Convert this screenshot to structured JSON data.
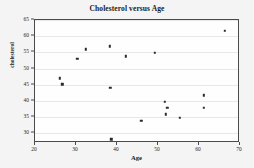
{
  "chart_data": {
    "type": "scatter",
    "title": "Cholesterol versus Age",
    "xlabel": "Age",
    "ylabel": "cholesterol",
    "xlim": [
      20,
      70
    ],
    "ylim": [
      27,
      65
    ],
    "xticks": [
      20,
      30,
      40,
      50,
      60,
      70
    ],
    "yticks": [
      30,
      35,
      40,
      45,
      50,
      55,
      60,
      65
    ],
    "grid": "horizontal",
    "legend": "none",
    "marker": "filled-square",
    "marker_color": "#2a2a2a",
    "points": [
      {
        "x": 26.0,
        "y": 47.0
      },
      {
        "x": 26.7,
        "y": 45.1
      },
      {
        "x": 30.3,
        "y": 53.0
      },
      {
        "x": 32.4,
        "y": 56.0
      },
      {
        "x": 38.2,
        "y": 56.9
      },
      {
        "x": 38.4,
        "y": 44.1
      },
      {
        "x": 38.6,
        "y": 28.1
      },
      {
        "x": 42.2,
        "y": 53.8
      },
      {
        "x": 45.9,
        "y": 33.9
      },
      {
        "x": 49.2,
        "y": 54.9
      },
      {
        "x": 51.6,
        "y": 39.8
      },
      {
        "x": 51.9,
        "y": 35.9
      },
      {
        "x": 52.3,
        "y": 37.8
      },
      {
        "x": 55.3,
        "y": 34.8
      },
      {
        "x": 61.1,
        "y": 41.7
      },
      {
        "x": 61.2,
        "y": 37.8
      },
      {
        "x": 66.3,
        "y": 61.7
      }
    ]
  },
  "colors": {
    "page_background": "#f2f2f2",
    "plot_background": "#fefefe",
    "frame": "#4a4a4a",
    "gridline": "#e8e8e8",
    "text": "#1b1b1b"
  }
}
